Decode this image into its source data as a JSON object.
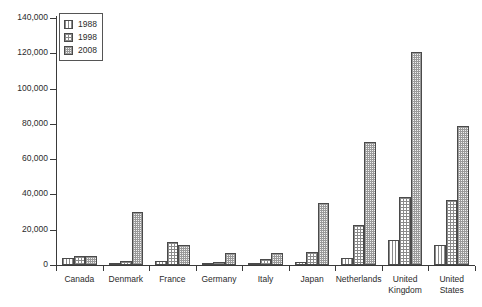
{
  "chart_data": {
    "type": "bar",
    "title": "",
    "xlabel": "",
    "ylabel": "",
    "ylim": [
      0,
      140000
    ],
    "ytick_step": 20000,
    "grid": false,
    "legend_position": "top-left",
    "categories": [
      "Canada",
      "Denmark",
      "France",
      "Germany",
      "Italy",
      "Japan",
      "Netherlands",
      "United Kingdom",
      "United States"
    ],
    "ytick_labels": [
      "0",
      "20,000",
      "40,000",
      "60,000",
      "80,000",
      "100,000",
      "120,000",
      "140,000"
    ],
    "ytick_values": [
      0,
      20000,
      40000,
      60000,
      80000,
      100000,
      120000,
      140000
    ],
    "series": [
      {
        "name": "1988",
        "pattern": "vertical-lines",
        "values": [
          4200,
          600,
          2500,
          1000,
          1000,
          1600,
          4000,
          14000,
          11500
        ]
      },
      {
        "name": "1998",
        "pattern": "cross-hatch",
        "values": [
          5100,
          2000,
          13000,
          1600,
          3600,
          7500,
          22500,
          38500,
          37000
        ]
      },
      {
        "name": "2008",
        "pattern": "dots",
        "values": [
          5200,
          30000,
          11500,
          7000,
          7000,
          35000,
          70000,
          120500,
          79000
        ]
      }
    ]
  },
  "legend": {
    "items": [
      {
        "label": "1988"
      },
      {
        "label": "1998"
      },
      {
        "label": "2008"
      }
    ]
  },
  "colors": {
    "axis": "#3a3a3a",
    "bar_outline": "#4a4a4a",
    "hatch": "#8a8a8a",
    "background": "#ffffff",
    "text": "#2b2b2b"
  }
}
